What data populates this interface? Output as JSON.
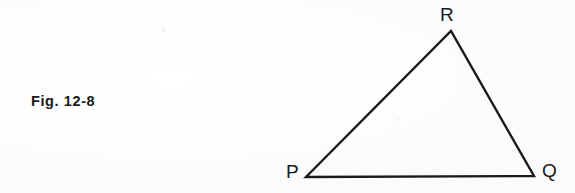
{
  "figure": {
    "caption": "Fig. 12-8",
    "ink_color": "#1a1a1a",
    "background_color": "#fefefe",
    "shape": "triangle",
    "vertices": [
      {
        "label": "P",
        "x": 306,
        "y": 177
      },
      {
        "label": "Q",
        "x": 534,
        "y": 176
      },
      {
        "label": "R",
        "x": 451,
        "y": 31
      }
    ],
    "labels": {
      "p": "P",
      "q": "Q",
      "r": "R"
    },
    "stroke_width": 2.4
  }
}
